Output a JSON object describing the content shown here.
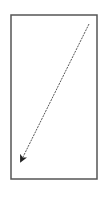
{
  "diagram": {
    "frame": {
      "x": 11,
      "y": 15,
      "width": 86,
      "height": 164,
      "stroke": "#555555",
      "stroke_width": 1.5
    },
    "arrow": {
      "x1": 89,
      "y1": 24,
      "x2": 21,
      "y2": 161,
      "stroke": "#555555",
      "dash": "2,1",
      "direction": "down-left",
      "head_color": "#222222"
    }
  },
  "colors": {
    "background": "#ffffff",
    "line": "#555555",
    "arrowhead": "#222222"
  }
}
